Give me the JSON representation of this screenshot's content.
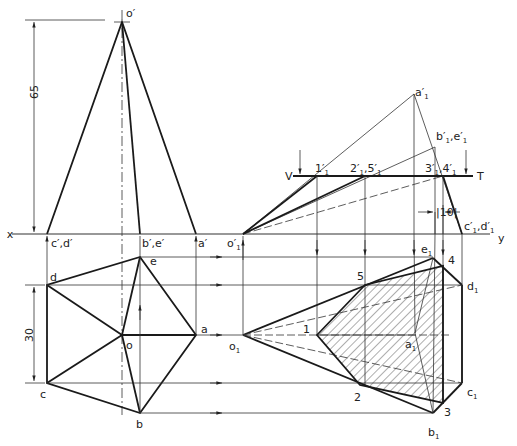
{
  "figure": {
    "front_view": {
      "apex_label": "o′",
      "base_labels": [
        "c′,d′",
        "b′,e′",
        "a′"
      ],
      "height_dimension": "65"
    },
    "reference_line": {
      "x_label": "x",
      "y_label": "y"
    },
    "top_view": {
      "vertex_labels": {
        "a": "a",
        "b": "b",
        "c": "c",
        "d": "d",
        "e": "e",
        "o": "o"
      },
      "side_dimension": "30"
    },
    "auxiliary_front_view": {
      "apex_label": "o′",
      "apex_sub": "1",
      "labels": [
        {
          "main": "a′",
          "sub": "1"
        },
        {
          "main": "b′",
          "sub": "1",
          "main2": ",e′",
          "sub2": "1"
        },
        {
          "main": "c′",
          "sub": "1",
          "main2": ",d′",
          "sub2": "1"
        }
      ],
      "section_plane": {
        "v_label": "V",
        "t_label": "T"
      },
      "section_points": [
        {
          "main": "1′",
          "sub": "1"
        },
        {
          "main": "2′",
          "sub": "1",
          "main2": ",5′",
          "sub2": "1"
        },
        {
          "main": "3′",
          "sub": "1",
          "main2": ",4′",
          "sub2": "1"
        }
      ],
      "offset_dimension": "10"
    },
    "auxiliary_top_view": {
      "apex_label": "o",
      "apex_sub": "1",
      "vertex_labels": [
        {
          "main": "a",
          "sub": "1"
        },
        {
          "main": "b",
          "sub": "1"
        },
        {
          "main": "c",
          "sub": "1"
        },
        {
          "main": "d",
          "sub": "1"
        },
        {
          "main": "e",
          "sub": "1"
        }
      ],
      "section_labels": [
        "1",
        "2",
        "3",
        "4",
        "5"
      ]
    }
  },
  "colors": {
    "line": "#1a1a1a",
    "background": "#ffffff",
    "hatch": "#333333"
  }
}
